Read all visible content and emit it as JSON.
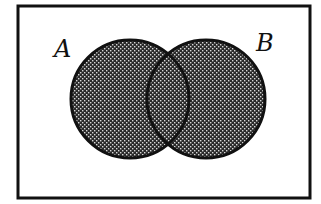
{
  "diagram": {
    "type": "venn",
    "universe": {
      "x": 18,
      "y": 6,
      "width": 292,
      "height": 192,
      "stroke": "#111111",
      "stroke_width": 3,
      "fill": "#ffffff"
    },
    "sets": [
      {
        "label": "A",
        "cx": 130,
        "cy": 99,
        "r": 59,
        "label_x": 56,
        "label_y": 57
      },
      {
        "label": "B",
        "cx": 206,
        "cy": 99,
        "r": 59,
        "label_x": 257,
        "label_y": 51
      }
    ],
    "shaded_region": "A ∪ B",
    "shading": {
      "pattern": "dot-checker",
      "dark_color": "#2a2a2a",
      "dot_color": "#d8d8d8",
      "cell_size": 4
    },
    "circle_stroke": "#111111",
    "circle_stroke_width": 3
  },
  "labels": {
    "set_a": "A",
    "set_b": "B"
  }
}
